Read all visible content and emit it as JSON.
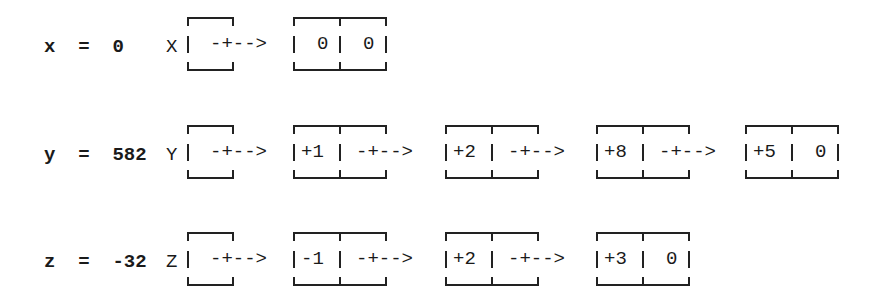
{
  "diagram": {
    "rows": [
      {
        "name": "x",
        "assignment": "x  =  0",
        "pointer_label": "X",
        "nodes": [
          {
            "digit": "0",
            "link": "0"
          }
        ]
      },
      {
        "name": "y",
        "assignment": "y  =  582",
        "pointer_label": "Y",
        "nodes": [
          {
            "digit": "+1",
            "link": "pointer"
          },
          {
            "digit": "+2",
            "link": "pointer"
          },
          {
            "digit": "+8",
            "link": "pointer"
          },
          {
            "digit": "+5",
            "link": "0"
          }
        ]
      },
      {
        "name": "z",
        "assignment": "z  =  -32",
        "pointer_label": "Z",
        "nodes": [
          {
            "digit": "-1",
            "link": "pointer"
          },
          {
            "digit": "+2",
            "link": "pointer"
          },
          {
            "digit": "+3",
            "link": "0"
          }
        ]
      }
    ],
    "arrow_text": "-+-->"
  },
  "rows": {
    "x": {
      "assign": "x  =  0",
      "label": "X",
      "arrow": "-+-->",
      "n1_digit": "0",
      "n1_link": "0"
    },
    "y": {
      "assign": "y  =  582",
      "label": "Y",
      "arrow": "-+-->",
      "n1_digit": "+1",
      "n2_digit": "+2",
      "n3_digit": "+8",
      "n4_digit": "+5",
      "n4_link": "0"
    },
    "z": {
      "assign": "z  =  -32",
      "label": "Z",
      "arrow": "-+-->",
      "n1_digit": "-1",
      "n2_digit": "+2",
      "n3_digit": "+3",
      "n3_link": "0"
    }
  }
}
